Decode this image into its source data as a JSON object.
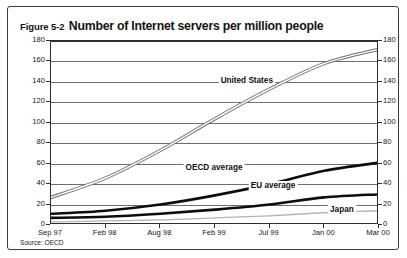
{
  "figure": {
    "title_prefix": "Figure 5-2",
    "title_main": "Number of Internet servers per million people",
    "source_note": "Source: OECD",
    "frame_color": "#3b3b3b"
  },
  "chart_data": {
    "type": "line",
    "title": "Number of Internet servers per million people",
    "xlabel": "",
    "ylabel": "",
    "ylim": [
      0,
      180
    ],
    "ytick_step": 20,
    "yticks": [
      0,
      20,
      40,
      60,
      80,
      100,
      120,
      140,
      160,
      180
    ],
    "yticks_right": [
      0,
      20,
      40,
      60,
      80,
      100,
      120,
      140,
      160,
      180
    ],
    "dual_y_axis": true,
    "grid": true,
    "grid_axis": "y",
    "legend": "inline-annotations",
    "categories": [
      "Sep 97",
      "Feb 98",
      "Aug 98",
      "Feb 99",
      "Jul 99",
      "Jan 00",
      "Mar 00"
    ],
    "x": [
      "Sep 97",
      "Feb 98",
      "Aug 98",
      "Feb 99",
      "Jul 99",
      "Jan 00",
      "Mar 00"
    ],
    "series": [
      {
        "name": "United States",
        "color": "#9a9a9a",
        "style": "outlined-thick",
        "values": [
          27,
          46,
          73,
          104,
          133,
          158,
          172
        ]
      },
      {
        "name": "OECD average",
        "color": "#0d0d0d",
        "style": "solid-thick",
        "values": [
          11,
          14,
          20,
          29,
          40,
          53,
          61
        ]
      },
      {
        "name": "EU average",
        "color": "#0d0d0d",
        "style": "solid-thick",
        "values": [
          7,
          8,
          11,
          15,
          20,
          27,
          30
        ]
      },
      {
        "name": "Japan",
        "color": "#b4b4b4",
        "style": "solid-thin",
        "values": [
          3,
          4,
          5,
          7,
          9,
          12,
          14
        ]
      }
    ],
    "annotations": [
      {
        "text": "United States",
        "x_frac": 0.6,
        "value": 140
      },
      {
        "text": "OECD average",
        "x_frac": 0.5,
        "value": 55
      },
      {
        "text": "EU average",
        "x_frac": 0.68,
        "value": 37
      },
      {
        "text": "Japan",
        "x_frac": 0.89,
        "value": 14
      }
    ]
  }
}
